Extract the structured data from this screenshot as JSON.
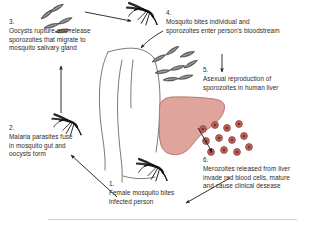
{
  "diagram": {
    "colors": {
      "text": "#2b2b2b",
      "ink": "#1a1a1a",
      "liver_fill": "#dfa49c",
      "liver_stroke": "#b8736c",
      "rbc_fill": "#c06a62",
      "rbc_stroke": "#8e3f38",
      "rbc_core": "#7d332c",
      "body_stroke": "#555555",
      "frame_line": "#c9c9c9",
      "background": "#ffffff"
    },
    "steps": [
      {
        "number": "1.",
        "text": "Female mosquito bites\ninfected person"
      },
      {
        "number": "2.",
        "text": "Malaria parasites fuse\nin mosquito gut and\noocysts form"
      },
      {
        "number": "3.",
        "text": "Oocysts rupture and release\nsporozoites that migrate to\nmosquito salivary gland"
      },
      {
        "number": "4.",
        "text": "Mosquito bites individual and\nsporozoites enter person's bloodstream"
      },
      {
        "number": "5.",
        "text": "Asexual reproduction of\nsporozoites in human liver"
      },
      {
        "number": "6.",
        "text": "Merozoites released from liver\ninvade red blood cells, mature\nand cause clinical desease"
      }
    ],
    "figures": {
      "mosquito_top": "mosquito-icon",
      "mosquito_left": "mosquito-icon",
      "mosquito_bottom": "mosquito-icon",
      "human": "human-torso-outline",
      "liver": "liver-organ",
      "sporozoites_left": "sporozoite-cluster",
      "sporozoites_right": "sporozoite-cluster",
      "red_blood_cells": "red-blood-cell-cluster"
    }
  }
}
